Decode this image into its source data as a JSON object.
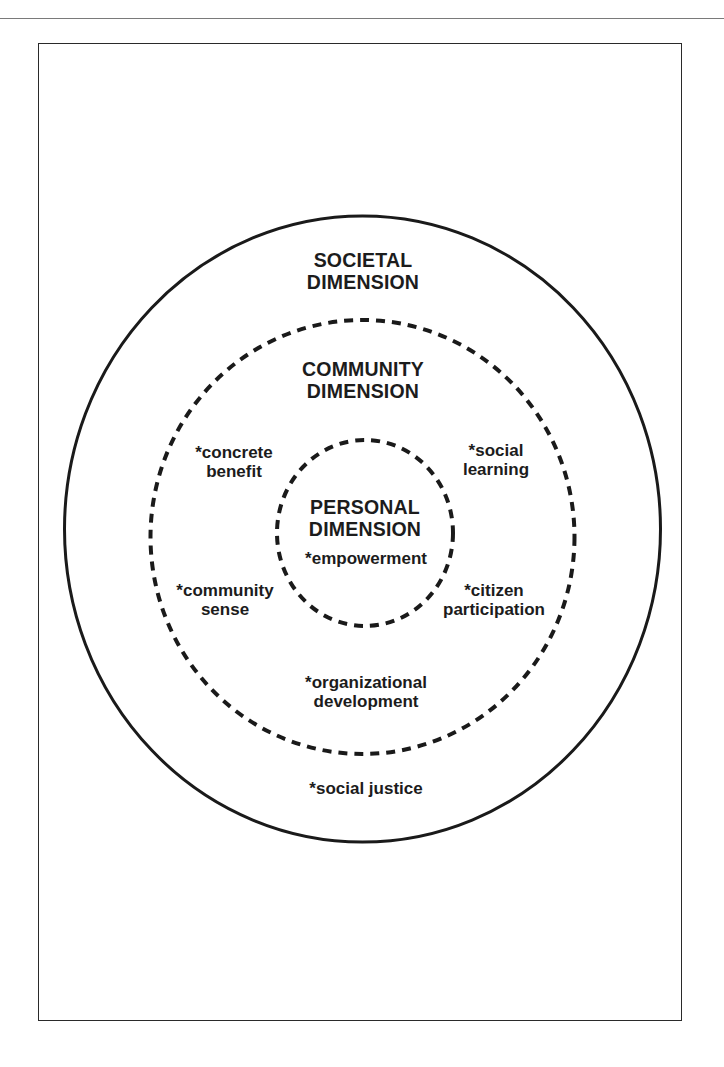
{
  "page": {
    "header_rule": true
  },
  "diagram": {
    "frame": {
      "stroke": "#2a2a2a"
    },
    "colors": {
      "stroke": "#1a1a1a",
      "text": "#1c1c1c",
      "background": "#ffffff"
    },
    "dimensions": [
      {
        "id": "societal",
        "title_lines": [
          "SOCIETAL",
          "DIMENSION"
        ],
        "border": "solid",
        "items": [
          {
            "lines": [
              "*social justice"
            ]
          }
        ]
      },
      {
        "id": "community",
        "title_lines": [
          "COMMUNITY",
          "DIMENSION"
        ],
        "border": "dashed",
        "items": [
          {
            "lines": [
              "*concrete",
              "benefit"
            ]
          },
          {
            "lines": [
              "*social",
              "learning"
            ]
          },
          {
            "lines": [
              "*community",
              "sense"
            ]
          },
          {
            "lines": [
              "*citizen",
              "participation"
            ]
          },
          {
            "lines": [
              "*organizational",
              "development"
            ]
          }
        ]
      },
      {
        "id": "personal",
        "title_lines": [
          "PERSONAL",
          "DIMENSION"
        ],
        "border": "dashed",
        "items": [
          {
            "lines": [
              "*empowerment"
            ]
          }
        ]
      }
    ]
  }
}
